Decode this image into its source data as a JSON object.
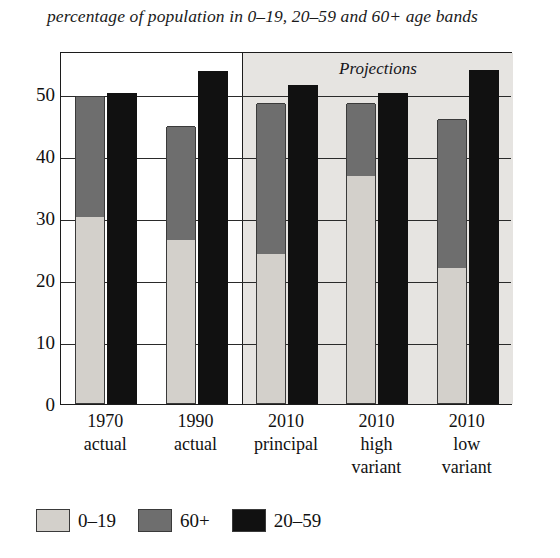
{
  "chart_data": {
    "type": "bar",
    "title": "percentage of population in 0–19, 20–59 and 60+ age bands",
    "xlabel": "",
    "ylabel": "",
    "ylim": [
      0,
      57
    ],
    "yticks": [
      0,
      10,
      20,
      30,
      40,
      50
    ],
    "ytick_labels": [
      "0",
      "10",
      "20",
      "30",
      "40",
      "50"
    ],
    "grid": true,
    "legend_position": "bottom-left",
    "annotation": "Projections",
    "categories": [
      "1970 actual",
      "1990 actual",
      "2010 principal",
      "2010 high variant",
      "2010 low variant"
    ],
    "category_lines": [
      [
        "1970",
        "actual"
      ],
      [
        "1990",
        "actual"
      ],
      [
        "2010",
        "principal"
      ],
      [
        "2010",
        "high",
        "variant"
      ],
      [
        "2010",
        "low",
        "variant"
      ]
    ],
    "series": [
      {
        "name": "0–19",
        "color": "#d3d0cb",
        "values": [
          30.0,
          26.3,
          24.0,
          36.7,
          21.8
        ]
      },
      {
        "name": "60+",
        "color": "#6e6e6e",
        "values": [
          19.5,
          18.5,
          24.5,
          11.8,
          24.1
        ]
      },
      {
        "name": "20–59",
        "color": "#111111",
        "values": [
          50.3,
          53.8,
          51.5,
          50.3,
          54.0
        ]
      }
    ],
    "stack_totals": [
      49.5,
      44.8,
      48.5,
      48.5,
      45.9
    ],
    "projection_start_index": 2
  },
  "legend": {
    "items": [
      {
        "label": "0–19",
        "color": "#d3d0cb"
      },
      {
        "label": "60+",
        "color": "#6e6e6e"
      },
      {
        "label": "20–59",
        "color": "#111111"
      }
    ]
  }
}
